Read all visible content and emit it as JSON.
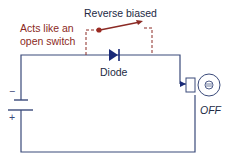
{
  "diagram": {
    "title_label": "Reverse biased",
    "annotation_line1": "Acts like an",
    "annotation_line2": "open switch",
    "diode_label": "Diode",
    "lamp_state": "OFF",
    "battery_minus": "−",
    "battery_plus": "+",
    "colors": {
      "wire": "#3a4a7a",
      "annotation": "#8b2a24",
      "switch": "#8b2a24",
      "switch_dot": "#9b2a22",
      "diode": "#1a2a78",
      "text": "#222a44",
      "dashed": "#8b2a24"
    }
  }
}
